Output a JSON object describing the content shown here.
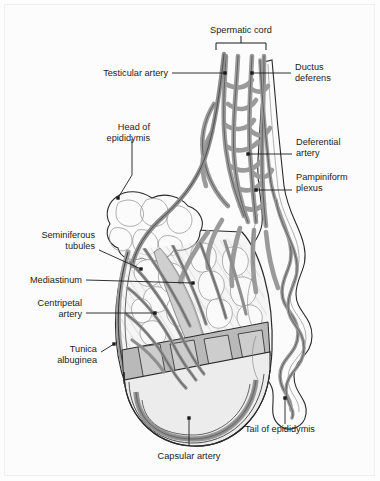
{
  "figure": {
    "background_color": "#fcfcfc",
    "line_color": "#1b1b1b",
    "vessel_fill": "#9a9a9a",
    "vessel_stroke": "#4a4a4a",
    "tissue_fill": "#f2f2f2",
    "capsule_fill": "#d8d8d8",
    "lobule_fill": "#c9c9c9"
  },
  "bracket": {
    "label": "Spermatic cord",
    "name": "spermatic-cord-bracket"
  },
  "labels": [
    {
      "id": "testicular-artery",
      "lines": [
        "Testicular artery"
      ],
      "anchor": "end",
      "text_x": 168,
      "text_y": 76,
      "line_height": 11,
      "leader": [
        [
          172,
          73
        ],
        [
          225,
          73
        ]
      ],
      "dot": [
        225,
        73
      ]
    },
    {
      "id": "ductus-deferens",
      "lines": [
        "Ductus",
        "deferens"
      ],
      "anchor": "start",
      "text_x": 295,
      "text_y": 70,
      "line_height": 11,
      "leader": [
        [
          291,
          73
        ],
        [
          252,
          73
        ]
      ],
      "dot": [
        252,
        73
      ]
    },
    {
      "id": "head-of-epididymis",
      "lines": [
        "Head of",
        "epididymis"
      ],
      "anchor": "end",
      "text_x": 150,
      "text_y": 130,
      "line_height": 11,
      "leader": [
        [
          132,
          139
        ],
        [
          132,
          175
        ],
        [
          118,
          198
        ]
      ],
      "dot": [
        118,
        198
      ]
    },
    {
      "id": "deferential-artery",
      "lines": [
        "Deferential",
        "artery"
      ],
      "anchor": "start",
      "text_x": 296,
      "text_y": 145,
      "line_height": 11,
      "leader": [
        [
          292,
          154
        ],
        [
          248,
          154
        ]
      ],
      "dot": [
        248,
        154
      ]
    },
    {
      "id": "pampiniform-plexus",
      "lines": [
        "Pampiniform",
        "plexus"
      ],
      "anchor": "start",
      "text_x": 296,
      "text_y": 180,
      "line_height": 11,
      "leader": [
        [
          292,
          190
        ],
        [
          256,
          190
        ]
      ],
      "dot": [
        256,
        190
      ]
    },
    {
      "id": "seminiferous-tubules",
      "lines": [
        "Seminiferous",
        "tubules"
      ],
      "anchor": "end",
      "text_x": 95,
      "text_y": 238,
      "line_height": 11,
      "leader": [
        [
          99,
          250
        ],
        [
          141,
          269
        ]
      ],
      "dot": [
        141,
        269
      ]
    },
    {
      "id": "mediastinum",
      "lines": [
        "Mediastinum"
      ],
      "anchor": "end",
      "text_x": 82,
      "text_y": 283,
      "line_height": 11,
      "leader": [
        [
          86,
          280
        ],
        [
          193,
          283
        ]
      ],
      "dot": [
        193,
        283
      ]
    },
    {
      "id": "centripetal-artery",
      "lines": [
        "Centripetal",
        "artery"
      ],
      "anchor": "end",
      "text_x": 82,
      "text_y": 306,
      "line_height": 11,
      "leader": [
        [
          86,
          313
        ],
        [
          155,
          313
        ]
      ],
      "dot": [
        155,
        313
      ]
    },
    {
      "id": "tunica-albuginea",
      "lines": [
        "Tunica",
        "albuginea"
      ],
      "anchor": "end",
      "text_x": 97,
      "text_y": 352,
      "line_height": 11,
      "leader": [
        [
          101,
          352
        ],
        [
          114,
          344
        ]
      ],
      "dot": [
        114,
        344
      ]
    },
    {
      "id": "capsular-artery",
      "lines": [
        "Capsular artery"
      ],
      "anchor": "middle",
      "text_x": 189,
      "text_y": 459,
      "line_height": 11,
      "leader": [
        [
          189,
          446
        ],
        [
          189,
          418
        ]
      ],
      "dot": [
        189,
        418
      ]
    },
    {
      "id": "tail-of-epididymis",
      "lines": [
        "Tail of epididymis"
      ],
      "anchor": "start",
      "text_x": 245,
      "text_y": 432,
      "line_height": 11,
      "leader": [
        [
          285,
          424
        ],
        [
          285,
          398
        ]
      ],
      "dot": [
        285,
        398
      ]
    }
  ]
}
